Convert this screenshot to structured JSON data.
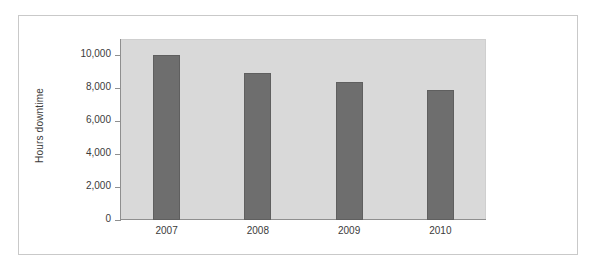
{
  "chart_data": {
    "type": "bar",
    "title": "",
    "subtitle": "",
    "xlabel": "",
    "ylabel": "Hours downtime",
    "categories": [
      "2007",
      "2008",
      "2009",
      "2010"
    ],
    "values": [
      10000,
      8950,
      8400,
      7880
    ],
    "series": [
      {
        "name": "Hours downtime",
        "values": [
          10000,
          8950,
          8400,
          7880
        ]
      }
    ],
    "ylim": [
      0,
      11000
    ],
    "ytick_values": [
      0,
      2000,
      4000,
      6000,
      8000,
      10000
    ],
    "ytick_labels": [
      "0",
      "2,000",
      "4,000",
      "6,000",
      "8,000",
      "10,000"
    ],
    "grid": false,
    "legend": false,
    "legend_position": "none",
    "colors": {
      "bar": "#6e6e6e",
      "bar_edge": "#5f5f5f",
      "plot_background": "#d9d9d9",
      "figure_background": "#ffffff",
      "frame_border": "#c9c9c9",
      "axis_line": "#8f8f8f",
      "text": "#3b3b3b"
    }
  }
}
